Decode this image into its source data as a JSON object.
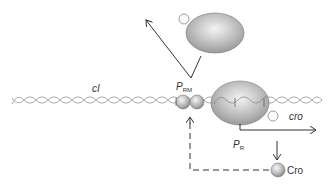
{
  "diagram": {
    "labels": {
      "cI_gene": "cI",
      "prm_main": "P",
      "prm_sub": "RM",
      "cro_gene": "cro",
      "pr_main": "P",
      "pr_sub": "R",
      "cro_protein": "Cro"
    },
    "colors": {
      "dna": "#a8a8a8",
      "protein_fill": "#b8b8b8",
      "protein_highlight": "#eeeeee",
      "arrow": "#333333",
      "text": "#333333"
    },
    "elements": [
      "DNA double helix",
      "cI repressor dimer bound at PRM",
      "RNA polymerase transcribing from PRM (leftward)",
      "RNA polymerase bound at PR",
      "Transcription arrow from PR (rightward) toward cro",
      "Cro protein product",
      "Dashed feedback arrow from Cro to PRM"
    ]
  }
}
